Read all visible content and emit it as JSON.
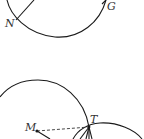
{
  "diagram": {
    "type": "geometry",
    "figures": [
      {
        "id": "top",
        "labels": {
          "N": "N",
          "G": "G"
        }
      },
      {
        "id": "bottom",
        "labels": {
          "M": "M",
          "T": "T"
        }
      }
    ],
    "colors": {
      "stroke": "#1a1a1a",
      "label": "#333333",
      "background": "#ffffff"
    }
  }
}
